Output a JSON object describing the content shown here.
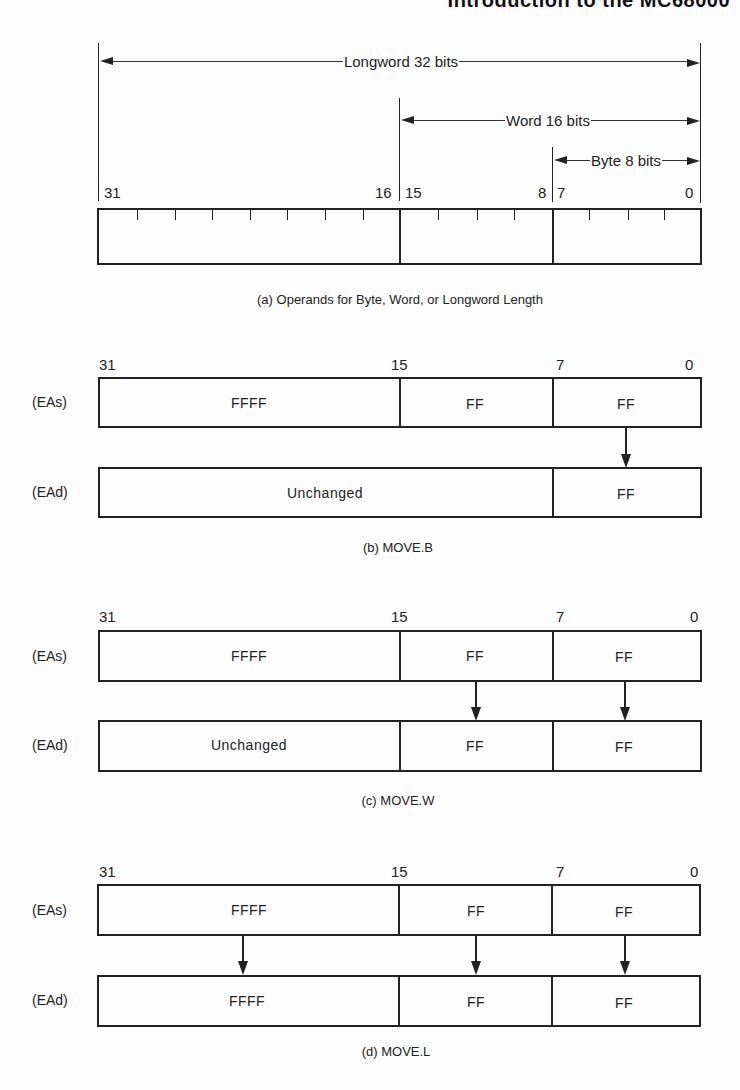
{
  "header": {
    "title": "Introduction to the MC68000"
  },
  "figure_a": {
    "dimensions": {
      "longword": "Longword 32 bits",
      "word": "Word 16 bits",
      "byte": "Byte 8 bits"
    },
    "bit_numbers": {
      "b31": "31",
      "b16": "16",
      "b15": "15",
      "b8": "8",
      "b7": "7",
      "b0": "0"
    },
    "caption": "(a)  Operands for Byte, Word, or Longword Length"
  },
  "figure_b": {
    "bit_numbers": {
      "b31": "31",
      "b15": "15",
      "b7": "7",
      "b0": "0"
    },
    "source": {
      "label": "(EAs)",
      "high": "FFFF",
      "mid": "FF",
      "low": "FF"
    },
    "dest": {
      "label": "(EAd)",
      "upper": "Unchanged",
      "low": "FF"
    },
    "caption": "(b)  MOVE.B"
  },
  "figure_c": {
    "bit_numbers": {
      "b31": "31",
      "b15": "15",
      "b7": "7",
      "b0": "0"
    },
    "source": {
      "label": "(EAs)",
      "high": "FFFF",
      "mid": "FF",
      "low": "FF"
    },
    "dest": {
      "label": "(EAd)",
      "high": "Unchanged",
      "mid": "FF",
      "low": "FF"
    },
    "caption": "(c)  MOVE.W"
  },
  "figure_d": {
    "bit_numbers": {
      "b31": "31",
      "b15": "15",
      "b7": "7",
      "b0": "0"
    },
    "source": {
      "label": "(EAs)",
      "high": "FFFF",
      "mid": "FF",
      "low": "FF"
    },
    "dest": {
      "label": "(EAd)",
      "high": "FFFF",
      "mid": "FF",
      "low": "FF"
    },
    "caption": "(d)  MOVE.L"
  }
}
